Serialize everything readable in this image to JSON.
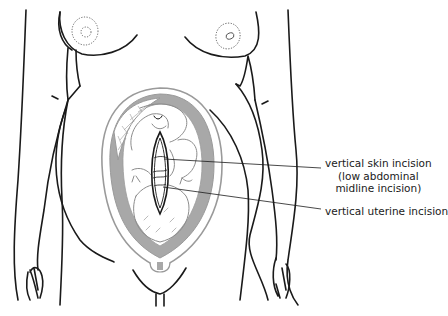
{
  "figure": {
    "colors": {
      "outline": "#1a1a1a",
      "uterus_outline": "#9a9a9a",
      "amniotic_fill": "#a8a8a8",
      "fetus_outline": "#8c8c8c",
      "background": "#ffffff"
    }
  },
  "labels": {
    "skin_incision": {
      "line1": "vertical skin incision",
      "line2": "(low abdominal",
      "line3": "midline incision)"
    },
    "uterine_incision": {
      "text": "vertical uterine incision"
    }
  }
}
